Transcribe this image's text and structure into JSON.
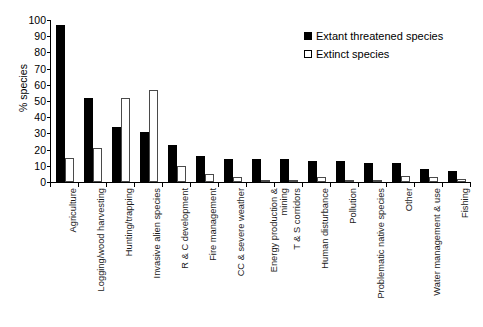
{
  "chart_data": {
    "type": "bar",
    "title": "",
    "xlabel": "",
    "ylabel": "% species",
    "ylim": [
      0,
      100
    ],
    "ytick_step": 10,
    "yticks": [
      100,
      90,
      80,
      70,
      60,
      50,
      40,
      30,
      20,
      10,
      0
    ],
    "grid": false,
    "legend_position": "top-right",
    "categories": [
      "Agriculture",
      "Logging/wood harvesting",
      "Hunting/trapping",
      "Invasive alien species",
      "R & C development",
      "Fire management",
      "CC & severe weather",
      "Energy production & mining",
      "T & S corridors",
      "Human disturbance",
      "Pollution",
      "Problematic native species",
      "Other",
      "Water management & use",
      "Fishing"
    ],
    "series": [
      {
        "name": "Extant threatened species",
        "color": "#000000",
        "style": "filled",
        "values": [
          97,
          52,
          34,
          31,
          23,
          16,
          14.5,
          14.5,
          14,
          13,
          13,
          11.5,
          11.5,
          8,
          7
        ]
      },
      {
        "name": "Extinct species",
        "color": "#ffffff",
        "style": "hollow",
        "values": [
          15,
          21,
          52,
          57,
          10,
          5,
          3,
          0.5,
          1,
          3,
          1.5,
          1,
          4,
          3,
          2
        ]
      }
    ]
  },
  "legend": {
    "entries": [
      {
        "label": "Extant threatened species",
        "swatch": "filled-square-icon"
      },
      {
        "label": "Extinct species",
        "swatch": "hollow-square-icon"
      }
    ]
  },
  "axis": {
    "y_title": "% species"
  }
}
